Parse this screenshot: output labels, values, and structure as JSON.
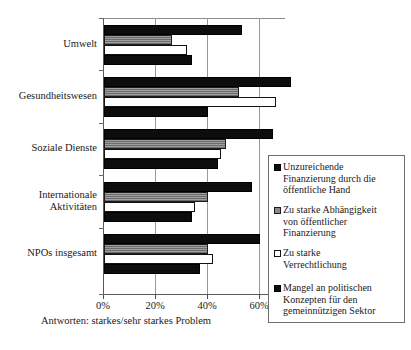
{
  "chart_data": {
    "type": "bar",
    "orientation": "horizontal",
    "title": "",
    "xlabel": "",
    "ylabel": "",
    "xlim": [
      0,
      70
    ],
    "xticks": [
      0,
      20,
      40,
      60
    ],
    "xtick_labels": [
      "0%",
      "20%",
      "40%",
      "60%"
    ],
    "grid": true,
    "legend_position": "right-inside",
    "categories": [
      "Umwelt",
      "Gesundheitswesen",
      "Soziale Dienste",
      "Internationale Aktivitäten",
      "NPOs insgesamt"
    ],
    "series": [
      {
        "name": "Unzureichende Finanzierung durch die öffentliche Hand",
        "color": "#0d0d0d",
        "values": [
          53,
          72,
          65,
          57,
          60
        ]
      },
      {
        "name": "Zu starke Abhängigkeit von öffentlicher Finanzierung",
        "color": "#8a8a8a",
        "values": [
          26,
          52,
          47,
          40,
          40
        ]
      },
      {
        "name": "Zu starke Verrechtlichung",
        "color": "#ffffff",
        "values": [
          32,
          66,
          45,
          35,
          42
        ]
      },
      {
        "name": "Mangel an politischen Konzepten für den gemeinnützigen Sektor",
        "color": "#0d0d0d",
        "values": [
          34,
          40,
          44,
          34,
          37
        ]
      }
    ],
    "note": "Antworten: starkes/sehr starkes Problem"
  },
  "axis": {
    "tick_labels": [
      "0%",
      "20%",
      "40%",
      "60%"
    ]
  },
  "categories": {
    "items": [
      {
        "label": "Umwelt",
        "lines": [
          "Umwelt"
        ]
      },
      {
        "label": "Gesundheitswesen",
        "lines": [
          "Gesundheitswesen"
        ]
      },
      {
        "label": "Soziale Dienste",
        "lines": [
          "Soziale Dienste"
        ]
      },
      {
        "label": "Internationale Aktivitäten",
        "lines": [
          "Internationale",
          "Aktivitäten"
        ]
      },
      {
        "label": "NPOs insgesamt",
        "lines": [
          "NPOs insgesamt"
        ]
      }
    ]
  },
  "legend": {
    "entries": [
      {
        "swatch": "black-square-icon",
        "text": "Unzureichende\nFinanzierung durch die\nöffentliche Hand"
      },
      {
        "swatch": "gray-square-icon",
        "text": "Zu starke Abhängigkeit\nvon öffentlicher\nFinanzierung"
      },
      {
        "swatch": "white-square-icon",
        "text": "Zu starke\nVerrechtlichung"
      },
      {
        "swatch": "black-square-icon",
        "text": "Mangel an politischen\nKonzepten für den\ngemeinnützigen Sektor"
      }
    ]
  },
  "footer": {
    "note": "Antworten: starkes/sehr starkes Problem"
  }
}
